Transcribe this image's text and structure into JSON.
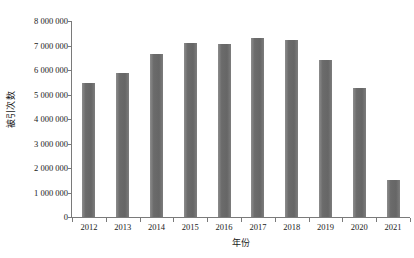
{
  "chart_data": {
    "type": "bar",
    "title": "",
    "subtitle": "",
    "xlabel": "年份",
    "ylabel": "被引次数",
    "categories": [
      "2012",
      "2013",
      "2014",
      "2015",
      "2016",
      "2017",
      "2018",
      "2019",
      "2020",
      "2021"
    ],
    "values": [
      5470000,
      5870000,
      6650000,
      7100000,
      7060000,
      7300000,
      7220000,
      6400000,
      5260000,
      1500000
    ],
    "series": [
      {
        "name": "被引次数",
        "values": [
          5470000,
          5870000,
          6650000,
          7100000,
          7060000,
          7300000,
          7220000,
          6400000,
          5260000,
          1500000
        ]
      }
    ],
    "ylim": [
      0,
      8000000
    ],
    "ytick_values": [
      0,
      1000000,
      2000000,
      3000000,
      4000000,
      5000000,
      6000000,
      7000000,
      8000000
    ],
    "ytick_labels": [
      "0",
      "1 000 000",
      "2 000 000",
      "3 000 000",
      "4 000 000",
      "5 000 000",
      "6 000 000",
      "7 000 000",
      "8 000 000"
    ],
    "grid": false,
    "legend": false,
    "legend_position": "none",
    "bar_color": "#6e6e6e",
    "axis_color": "#7a7a7a",
    "background_color": "#ffffff"
  }
}
